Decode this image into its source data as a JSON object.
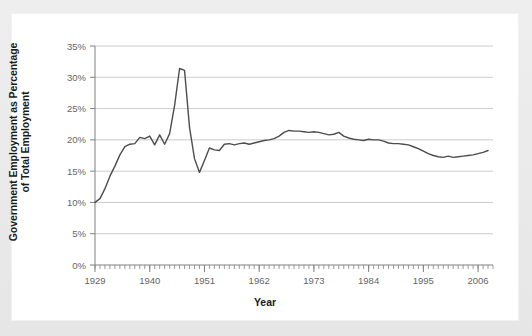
{
  "figure": {
    "background_color": "#e8e8e8",
    "panel_color": "#ffffff",
    "line_color": "#4d4d4d",
    "grid_color": "#cccccc",
    "axis_color": "#808080",
    "tick_label_color": "#666666"
  },
  "chart_data": {
    "type": "line",
    "title": "",
    "xlabel": "Year",
    "ylabel": "Government Employment as Percentage of Total Employment",
    "ylabel_line1": "Government Employment as Percentage",
    "ylabel_line2": "of Total Employment",
    "xlim": [
      1929,
      2009
    ],
    "ylim": [
      0,
      35
    ],
    "yticks": [
      0,
      5,
      10,
      15,
      20,
      25,
      30,
      35
    ],
    "ytick_labels": [
      "0%",
      "5%",
      "10%",
      "15%",
      "20%",
      "25%",
      "30%",
      "35%"
    ],
    "xticks": [
      1929,
      1940,
      1951,
      1962,
      1973,
      1984,
      1995,
      2006
    ],
    "xtick_labels": [
      "1929",
      "1940",
      "1951",
      "1962",
      "1973",
      "1984",
      "1995",
      "2006"
    ],
    "minor_xtick_interval": 1,
    "grid": "horizontal",
    "legend": "none",
    "series": [
      {
        "name": "Government Employment as Percentage of Total Employment",
        "x": [
          1929,
          1930,
          1931,
          1932,
          1933,
          1934,
          1935,
          1936,
          1937,
          1938,
          1939,
          1940,
          1941,
          1942,
          1943,
          1944,
          1945,
          1946,
          1947,
          1948,
          1949,
          1950,
          1951,
          1952,
          1953,
          1954,
          1955,
          1956,
          1957,
          1958,
          1959,
          1960,
          1961,
          1962,
          1963,
          1964,
          1965,
          1966,
          1967,
          1968,
          1969,
          1970,
          1971,
          1972,
          1973,
          1974,
          1975,
          1976,
          1977,
          1978,
          1979,
          1980,
          1981,
          1982,
          1983,
          1984,
          1985,
          1986,
          1987,
          1988,
          1989,
          1990,
          1991,
          1992,
          1993,
          1994,
          1995,
          1996,
          1997,
          1998,
          1999,
          2000,
          2001,
          2002,
          2003,
          2004,
          2005,
          2006,
          2007,
          2008
        ],
        "values": [
          10.0,
          10.6,
          12.2,
          14.2,
          15.8,
          17.6,
          18.9,
          19.3,
          19.4,
          20.4,
          20.2,
          20.6,
          19.2,
          20.8,
          19.3,
          21.0,
          25.5,
          31.4,
          31.1,
          22.0,
          17.0,
          14.8,
          16.7,
          18.7,
          18.4,
          18.3,
          19.3,
          19.4,
          19.2,
          19.4,
          19.5,
          19.3,
          19.5,
          19.7,
          19.9,
          20.0,
          20.2,
          20.6,
          21.2,
          21.5,
          21.4,
          21.4,
          21.3,
          21.2,
          21.3,
          21.2,
          21.0,
          20.8,
          20.9,
          21.2,
          20.6,
          20.3,
          20.1,
          20.0,
          19.9,
          20.1,
          20.0,
          20.0,
          19.8,
          19.5,
          19.4,
          19.4,
          19.3,
          19.2,
          18.9,
          18.6,
          18.2,
          17.8,
          17.5,
          17.3,
          17.2,
          17.4,
          17.2,
          17.3,
          17.4,
          17.5,
          17.6,
          17.8,
          18.0,
          18.3
        ]
      }
    ]
  }
}
